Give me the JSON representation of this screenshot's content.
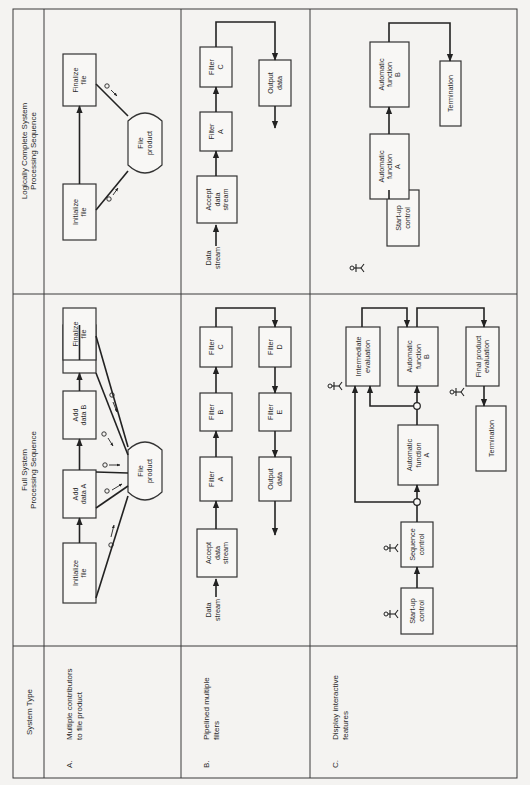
{
  "table": {
    "orientation": "rotated-90-ccw",
    "headers": {
      "system_type": "System Type",
      "full_system": [
        "Full System",
        "Processing Sequence"
      ],
      "logically_complete": [
        "Logically Complete System",
        "Processing Sequence"
      ]
    },
    "rows": [
      {
        "id": "A",
        "letter": "A.",
        "system_type": [
          "Multiple contributors",
          "to file product"
        ],
        "full_system": {
          "boxes": [
            {
              "id": "init",
              "lines": [
                "Initialize",
                "file"
              ],
              "x": 63,
              "y": 543,
              "w": 33,
              "h": 60
            },
            {
              "id": "adda",
              "lines": [
                "Add",
                "data A"
              ],
              "x": 63,
              "y": 470,
              "w": 33,
              "h": 48
            },
            {
              "id": "addb",
              "lines": [
                "Add",
                "data B"
              ],
              "x": 63,
              "y": 391,
              "w": 33,
              "h": 48
            },
            {
              "id": "addc",
              "lines": [
                "Add",
                "data C"
              ],
              "x": 63,
              "y": 325,
              "w": 33,
              "h": 48
            },
            {
              "id": "final",
              "lines": [
                "Finalize",
                "file"
              ],
              "x": 63,
              "y": 308,
              "w": 33,
              "h": 0
            },
            {
              "id": "product",
              "lines": [
                "File",
                "product"
              ],
              "shape": "drum",
              "x": 128,
              "y": 440,
              "w": 34,
              "h": 62
            }
          ]
        },
        "logically_complete": {
          "boxes": [
            {
              "id": "init",
              "lines": [
                "Initialize",
                "file"
              ],
              "x": 63,
              "y": 184,
              "w": 33,
              "h": 56
            },
            {
              "id": "final",
              "lines": [
                "Finalize",
                "file"
              ],
              "x": 63,
              "y": 54,
              "w": 33,
              "h": 52
            },
            {
              "id": "product",
              "lines": [
                "File",
                "product"
              ],
              "shape": "drum",
              "x": 128,
              "y": 111,
              "w": 34,
              "h": 64
            }
          ]
        }
      },
      {
        "id": "B",
        "letter": "B.",
        "system_type": [
          "Pipelined multiple",
          "filters"
        ],
        "full_system": {
          "input_label": [
            "Data",
            "stream"
          ],
          "boxes": [
            {
              "id": "accept",
              "lines": [
                "Accept",
                "data",
                "stream"
              ]
            },
            {
              "id": "fa",
              "lines": [
                "Filter",
                "A"
              ]
            },
            {
              "id": "fb",
              "lines": [
                "Filter",
                "B"
              ]
            },
            {
              "id": "fc",
              "lines": [
                "Filter",
                "C"
              ]
            },
            {
              "id": "fd",
              "lines": [
                "Filter",
                "D"
              ]
            },
            {
              "id": "fe",
              "lines": [
                "Filter",
                "E"
              ]
            },
            {
              "id": "out",
              "lines": [
                "Output",
                "data"
              ]
            }
          ]
        },
        "logically_complete": {
          "input_label": [
            "Data",
            "stream"
          ],
          "boxes": [
            {
              "id": "accept",
              "lines": [
                "Accept",
                "data",
                "stream"
              ]
            },
            {
              "id": "fa",
              "lines": [
                "Filter",
                "A"
              ]
            },
            {
              "id": "fc",
              "lines": [
                "Filter",
                "C"
              ]
            },
            {
              "id": "out",
              "lines": [
                "Output",
                "data"
              ]
            }
          ]
        }
      },
      {
        "id": "C",
        "letter": "C.",
        "system_type": [
          "Display interactive",
          "features"
        ],
        "full_system": {
          "boxes": [
            {
              "id": "startup",
              "lines": [
                "Start-up",
                "control"
              ]
            },
            {
              "id": "seq",
              "lines": [
                "Sequence",
                "control"
              ]
            },
            {
              "id": "afa",
              "lines": [
                "Automatic",
                "function",
                "A"
              ]
            },
            {
              "id": "inter",
              "lines": [
                "Intermediate",
                "evaluation"
              ]
            },
            {
              "id": "afb",
              "lines": [
                "Automatic",
                "function",
                "B"
              ]
            },
            {
              "id": "fpe",
              "lines": [
                "Final product",
                "evaluation"
              ]
            },
            {
              "id": "term",
              "lines": [
                "Termination"
              ]
            }
          ],
          "operator_icons": 4
        },
        "logically_complete": {
          "boxes": [
            {
              "id": "startup",
              "lines": [
                "Start-up",
                "control"
              ]
            },
            {
              "id": "afa",
              "lines": [
                "Automatic",
                "function",
                "A"
              ]
            },
            {
              "id": "afb",
              "lines": [
                "Automatic",
                "function",
                "B"
              ]
            },
            {
              "id": "term",
              "lines": [
                "Termination"
              ]
            }
          ],
          "operator_icons": 1
        }
      }
    ]
  },
  "colors": {
    "line": "#222222",
    "background": "#f4f3f1",
    "box_fill": "#f8f7f5"
  }
}
